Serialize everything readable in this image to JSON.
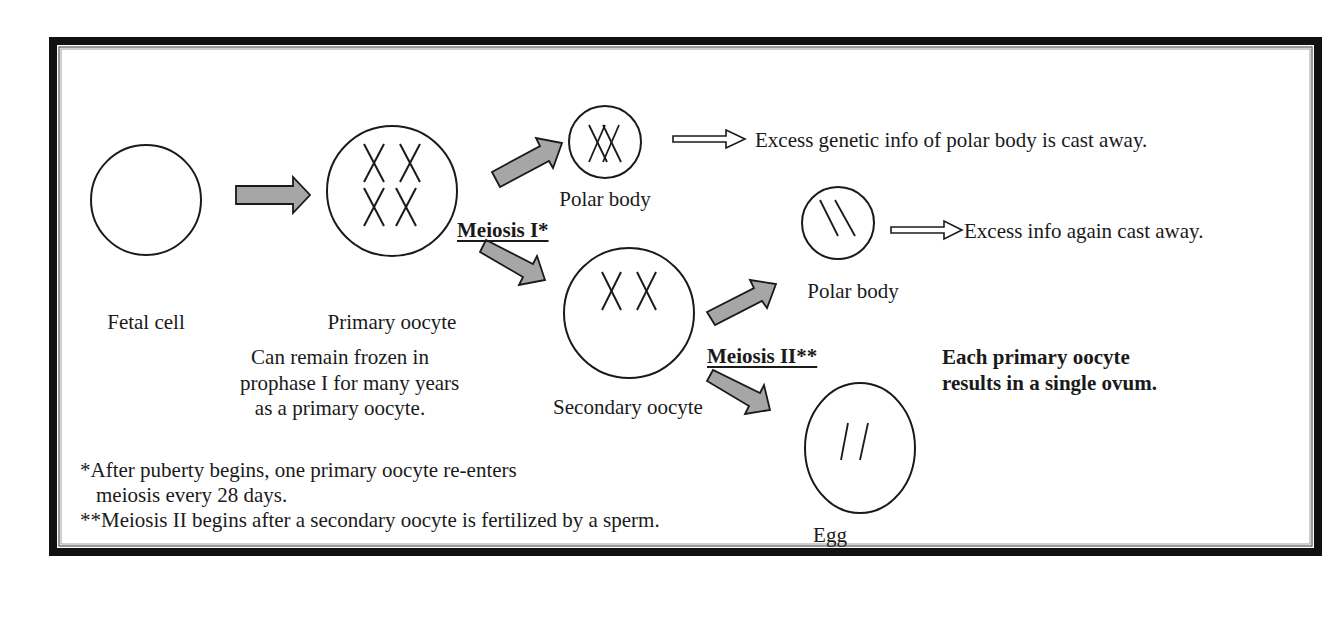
{
  "cells": {
    "fetal_cell": "Fetal cell",
    "primary_oocyte": "Primary oocyte",
    "polar_body_1": "Polar body",
    "polar_body_2": "Polar body",
    "secondary_oocyte": "Secondary oocyte",
    "egg": "Egg"
  },
  "stages": {
    "meiosis_1": "Meiosis I*",
    "meiosis_2": "Meiosis II**"
  },
  "annotations": {
    "polar_body_1_fate": "Excess genetic info of polar body is cast away.",
    "polar_body_2_fate": "Excess info again cast away.",
    "frozen_note_line1": "Can remain frozen in",
    "frozen_note_line2": "prophase I for many years",
    "frozen_note_line3": "as a primary oocyte.",
    "summary_line1": "Each primary oocyte",
    "summary_line2": "results in a single ovum."
  },
  "footnotes": {
    "note1_line1": "*After puberty begins, one primary oocyte re-enters",
    "note1_line2": "meiosis every 28 days.",
    "note2": "**Meiosis II begins after a secondary oocyte is fertilized by a sperm."
  },
  "colors": {
    "border": "#111111",
    "arrow_fill": "#a6a6a6",
    "stroke": "#1a1a1a"
  }
}
